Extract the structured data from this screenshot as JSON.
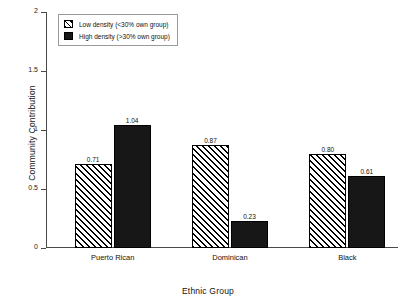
{
  "chart_data": {
    "type": "bar",
    "title": "",
    "xlabel": "Ethnic Group",
    "ylabel": "Community Contribution",
    "categories": [
      "Puerto Rican",
      "Dominican",
      "Black"
    ],
    "series": [
      {
        "name": "Low density (<30% own group)",
        "pattern": "diagonal-hatch",
        "color": "#ffffff",
        "values": [
          0.71,
          0.87,
          0.8
        ],
        "labels": [
          "0.71",
          "0.87",
          "0.80"
        ]
      },
      {
        "name": "High density (>30% own group)",
        "pattern": "solid",
        "color": "#171717",
        "values": [
          1.04,
          0.23,
          0.61
        ],
        "labels": [
          "1.04",
          "0.23",
          "0.61"
        ]
      }
    ],
    "ylim": [
      0,
      2
    ],
    "yticks": [
      0,
      0.5,
      1,
      1.5,
      2
    ],
    "ytick_labels": [
      "0",
      "0.5",
      "1",
      "1.5",
      "2"
    ],
    "grid": false,
    "legend_position": "upper-left"
  },
  "legend": {
    "items": [
      {
        "label": "Low density (<30% own group)"
      },
      {
        "label": "High density (>30% own group)"
      }
    ]
  }
}
